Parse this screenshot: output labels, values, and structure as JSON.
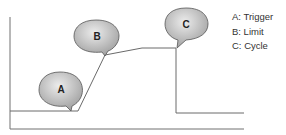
{
  "diagram": {
    "markers": [
      {
        "label": "A",
        "meaning": "Trigger"
      },
      {
        "label": "B",
        "meaning": "Limit"
      },
      {
        "label": "C",
        "meaning": "Cycle"
      }
    ],
    "legend": [
      "A: Trigger",
      "B: Limit",
      "C: Cycle"
    ],
    "colors": {
      "line": "#707070",
      "bubble_light": "#e8e8e8",
      "bubble_dark": "#9a9a9a",
      "text": "#222222"
    }
  }
}
